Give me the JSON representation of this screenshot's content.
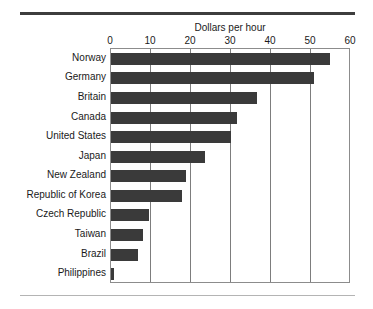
{
  "chart_data": {
    "type": "bar",
    "orientation": "horizontal",
    "title": "Dollars per hour",
    "xlabel": "",
    "ylabel": "",
    "xlim": [
      0,
      60
    ],
    "xticks": [
      0,
      10,
      20,
      30,
      40,
      50,
      60
    ],
    "xtick_labels": [
      "0",
      "10",
      "20",
      "30",
      "40",
      "50",
      "60"
    ],
    "grid": true,
    "grid_axis": "x",
    "legend": false,
    "categories": [
      "Norway",
      "Germany",
      "Britain",
      "Canada",
      "United States",
      "Japan",
      "New Zealand",
      "Republic of Korea",
      "Czech Republic",
      "Taiwan",
      "Brazil",
      "Philippines"
    ],
    "values": [
      54.8,
      50.8,
      36.5,
      31.5,
      30.0,
      23.5,
      18.8,
      17.8,
      9.5,
      8.0,
      6.8,
      0.8
    ],
    "bar_color": "#3a3a3a",
    "plot_border_color": "#8c8c8c",
    "gridline_color": "#7d7d7d",
    "top_rule_color": "#3d3d3d",
    "bottom_rule_color": "#b4b4b4"
  }
}
